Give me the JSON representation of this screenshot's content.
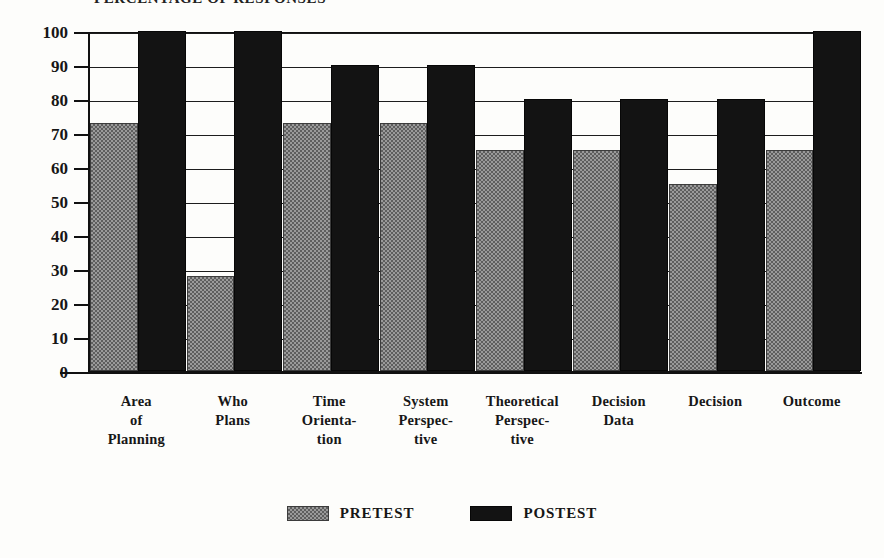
{
  "chart_data": {
    "type": "bar",
    "title": "PERCENTAGE OF RESPONSES",
    "xlabel": "",
    "ylabel": "",
    "ylim": [
      0,
      100
    ],
    "ytick_labels": [
      "100",
      "90",
      "80",
      "70",
      "60",
      "50",
      "40",
      "30",
      "20",
      "10",
      "0"
    ],
    "yticks": [
      100,
      90,
      80,
      70,
      60,
      50,
      40,
      30,
      20,
      10,
      0
    ],
    "grid": true,
    "legend_position": "bottom-center",
    "categories": [
      "Area of Planning",
      "Who Plans",
      "Time Orientation",
      "System Perspective",
      "Theoretical Perspective",
      "Decision Data",
      "Decision",
      "Outcome"
    ],
    "category_lines": [
      [
        "Area",
        "of",
        "Planning"
      ],
      [
        "Who",
        "Plans"
      ],
      [
        "Time",
        "Orienta-",
        "tion"
      ],
      [
        "System",
        "Perspec-",
        "tive"
      ],
      [
        "Theoretical",
        "Perspec-",
        "tive"
      ],
      [
        "Decision",
        "Data"
      ],
      [
        "Decision"
      ],
      [
        "Outcome"
      ]
    ],
    "series": [
      {
        "name": "PRETEST",
        "values": [
          73,
          28,
          73,
          73,
          65,
          65,
          55,
          65
        ]
      },
      {
        "name": "POSTEST",
        "values": [
          100,
          100,
          90,
          90,
          80,
          80,
          80,
          100
        ]
      }
    ]
  },
  "legend": {
    "entries": [
      {
        "label": "PRETEST",
        "color": "#9a9a9a",
        "pattern": "hatched"
      },
      {
        "label": "POSTEST",
        "color": "#131313",
        "pattern": "solid"
      }
    ]
  },
  "colors": {
    "pretest": "#9a9a9a",
    "postest": "#131313",
    "axis": "#111111",
    "background": "#fdfdfb"
  }
}
